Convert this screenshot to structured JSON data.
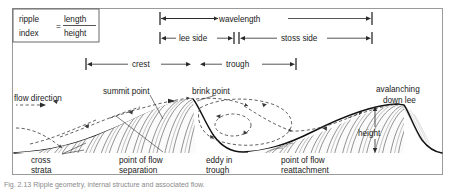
{
  "figure": {
    "type": "bedform-cross-section-diagram",
    "caption": "Fig. 2.13 Ripple geometry, internal structure and associated flow."
  },
  "formula_box": {
    "name_line1": "ripple",
    "name_line2": "index",
    "equals": "=",
    "numerator": "length",
    "denominator": "height"
  },
  "dimensions": [
    {
      "id": "wavelength",
      "label": "wavelength",
      "row": 1,
      "x_start": 160,
      "x_end": 372,
      "y": 18
    },
    {
      "id": "lee-side",
      "label": "lee side",
      "row": 2,
      "x_start": 160,
      "x_end": 234,
      "y": 38
    },
    {
      "id": "stoss-side",
      "label": "stoss side",
      "row": 2,
      "x_start": 240,
      "x_end": 372,
      "y": 38
    },
    {
      "id": "crest",
      "label": "crest",
      "row": 3,
      "x_start": 86,
      "x_end": 192,
      "y": 64
    },
    {
      "id": "trough",
      "label": "trough",
      "row": 3,
      "x_start": 200,
      "x_end": 296,
      "y": 64
    },
    {
      "id": "height",
      "label": "height",
      "row": 4,
      "orientation": "vertical",
      "x": 375,
      "y_top": 107,
      "y_bottom": 152
    }
  ],
  "annotations": [
    {
      "id": "flow-direction",
      "label_lines": [
        "flow direction"
      ],
      "x": 14,
      "y": 98
    },
    {
      "id": "summit-point",
      "label_lines": [
        "summit point"
      ],
      "x": 103,
      "y": 91
    },
    {
      "id": "brink-point",
      "label_lines": [
        "brink point"
      ],
      "x": 192,
      "y": 91
    },
    {
      "id": "avalanching-down-lee",
      "label_lines": [
        "avalanching",
        "down lee"
      ],
      "x": 376,
      "y": 89
    },
    {
      "id": "cross-strata",
      "label_lines": [
        "cross",
        "strata"
      ],
      "x": 31,
      "y": 160
    },
    {
      "id": "point-of-flow-separation",
      "label_lines": [
        "point of flow",
        "separation"
      ],
      "x": 119,
      "y": 160
    },
    {
      "id": "eddy-in-trough",
      "label_lines": [
        "eddy in",
        "trough"
      ],
      "x": 206,
      "y": 160
    },
    {
      "id": "point-of-flow-reattachment",
      "label_lines": [
        "point of flow",
        "reattachment"
      ],
      "x": 281,
      "y": 160
    },
    {
      "id": "height-label",
      "label_lines": [
        "height"
      ],
      "x": 358,
      "y": 133
    }
  ],
  "colors": {
    "ink": "#1a1a1a",
    "bed_line": "#111111",
    "strata": "#3a3a3a",
    "frame": "#9a9a9a",
    "caption": "#8a8a8a",
    "background": "#ffffff"
  }
}
